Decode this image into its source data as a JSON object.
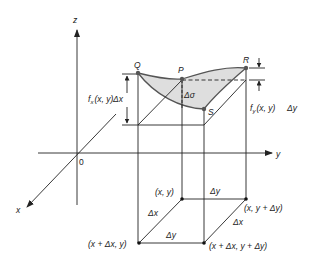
{
  "diagram": {
    "axes": {
      "z_label": "z",
      "y_label": "y",
      "x_label": "x",
      "origin_label": "0"
    },
    "surface_points": {
      "Q": "Q",
      "P": "P",
      "R": "R",
      "S": "S"
    },
    "surface_area_label": "Δσ",
    "left_annotation": {
      "f": "f",
      "sub": "x",
      "args": "(x, y)",
      "delta": "Δx"
    },
    "right_annotation": {
      "f": "f",
      "sub": "y",
      "args": "(x, y)",
      "delta": "Δy"
    },
    "base_corners": {
      "top_left": "(x, y)",
      "top_right": "(x, y + Δy)",
      "bottom_left": "(x + Δx, y)",
      "bottom_right": "(x + Δx, y + Δy)"
    },
    "base_edges": {
      "back": "Δy",
      "front": "Δy",
      "left": "Δx",
      "right": "Δx"
    },
    "colors": {
      "surface_fill": "#dedede",
      "line": "#222222",
      "point": "#555555"
    }
  }
}
